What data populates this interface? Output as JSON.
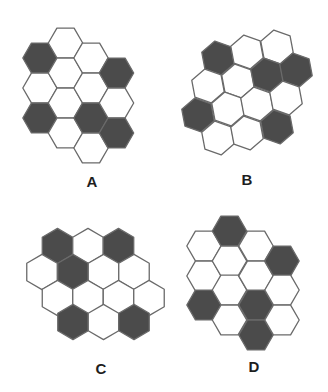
{
  "colors": {
    "filled": "#4b4b4b",
    "empty": "#ffffff",
    "stroke": "#6a6a6a",
    "label": "#1e1e1e"
  },
  "figures": [
    {
      "id": "A",
      "label": "A",
      "label_pos": [
        92,
        181
      ],
      "orientation": "flat-top",
      "rotation_deg": 0,
      "radius": 17.2,
      "hexes": [
        {
          "cx": 40,
          "cy": 58,
          "filled": true
        },
        {
          "cx": 40,
          "cy": 88,
          "filled": false
        },
        {
          "cx": 40,
          "cy": 118,
          "filled": true
        },
        {
          "cx": 65.5,
          "cy": 43,
          "filled": false
        },
        {
          "cx": 65.5,
          "cy": 73,
          "filled": false
        },
        {
          "cx": 65.5,
          "cy": 103,
          "filled": false
        },
        {
          "cx": 65.5,
          "cy": 133,
          "filled": false
        },
        {
          "cx": 91,
          "cy": 58,
          "filled": false
        },
        {
          "cx": 91,
          "cy": 88,
          "filled": false
        },
        {
          "cx": 91,
          "cy": 118,
          "filled": true
        },
        {
          "cx": 91,
          "cy": 148,
          "filled": false
        },
        {
          "cx": 116.5,
          "cy": 73,
          "filled": true
        },
        {
          "cx": 116.5,
          "cy": 103,
          "filled": false
        },
        {
          "cx": 116.5,
          "cy": 133,
          "filled": true
        }
      ]
    },
    {
      "id": "B",
      "label": "B",
      "label_pos": [
        247,
        179
      ],
      "orientation": "pointy-top",
      "rotation_deg": -10.6,
      "radius": 17.2,
      "hexes": [
        {
          "cx": 218,
          "cy": 58,
          "filled": true
        },
        {
          "cx": 247,
          "cy": 52,
          "filled": false
        },
        {
          "cx": 277,
          "cy": 47,
          "filled": false
        },
        {
          "cx": 208,
          "cy": 86,
          "filled": false
        },
        {
          "cx": 238,
          "cy": 81,
          "filled": false
        },
        {
          "cx": 267,
          "cy": 75,
          "filled": true
        },
        {
          "cx": 296,
          "cy": 70,
          "filled": true
        },
        {
          "cx": 198,
          "cy": 115,
          "filled": true
        },
        {
          "cx": 228,
          "cy": 109,
          "filled": false
        },
        {
          "cx": 257,
          "cy": 104,
          "filled": false
        },
        {
          "cx": 286,
          "cy": 98,
          "filled": false
        },
        {
          "cx": 218,
          "cy": 138,
          "filled": false
        },
        {
          "cx": 247,
          "cy": 133,
          "filled": false
        },
        {
          "cx": 277,
          "cy": 127,
          "filled": true
        }
      ]
    },
    {
      "id": "C",
      "label": "C",
      "label_pos": [
        101,
        368
      ],
      "orientation": "pointy-top",
      "rotation_deg": 0,
      "radius": 17.6,
      "hexes": [
        {
          "cx": 57.5,
          "cy": 246,
          "filled": true
        },
        {
          "cx": 88,
          "cy": 246,
          "filled": false
        },
        {
          "cx": 118.5,
          "cy": 246,
          "filled": true
        },
        {
          "cx": 42,
          "cy": 272,
          "filled": false
        },
        {
          "cx": 73,
          "cy": 272,
          "filled": true
        },
        {
          "cx": 103.5,
          "cy": 272,
          "filled": false
        },
        {
          "cx": 134,
          "cy": 272,
          "filled": false
        },
        {
          "cx": 57.5,
          "cy": 298,
          "filled": false
        },
        {
          "cx": 88,
          "cy": 298,
          "filled": false
        },
        {
          "cx": 118.5,
          "cy": 298,
          "filled": false
        },
        {
          "cx": 149,
          "cy": 298,
          "filled": false
        },
        {
          "cx": 73,
          "cy": 322,
          "filled": true
        },
        {
          "cx": 103.5,
          "cy": 322,
          "filled": false
        },
        {
          "cx": 134,
          "cy": 322,
          "filled": true
        }
      ]
    },
    {
      "id": "D",
      "label": "D",
      "label_pos": [
        254,
        366
      ],
      "orientation": "flat-top",
      "rotation_deg": 0,
      "radius": 17.2,
      "hexes": [
        {
          "cx": 204,
          "cy": 246,
          "filled": false
        },
        {
          "cx": 204,
          "cy": 276,
          "filled": false
        },
        {
          "cx": 204,
          "cy": 305,
          "filled": true
        },
        {
          "cx": 229.5,
          "cy": 231,
          "filled": true
        },
        {
          "cx": 229.5,
          "cy": 261,
          "filled": false
        },
        {
          "cx": 229.5,
          "cy": 290,
          "filled": false
        },
        {
          "cx": 229.5,
          "cy": 320,
          "filled": false
        },
        {
          "cx": 256,
          "cy": 246,
          "filled": false
        },
        {
          "cx": 256,
          "cy": 276,
          "filled": false
        },
        {
          "cx": 256,
          "cy": 305,
          "filled": true
        },
        {
          "cx": 256,
          "cy": 335,
          "filled": true
        },
        {
          "cx": 282,
          "cy": 261,
          "filled": true
        },
        {
          "cx": 282,
          "cy": 290,
          "filled": false
        },
        {
          "cx": 282,
          "cy": 320,
          "filled": false
        }
      ]
    }
  ]
}
